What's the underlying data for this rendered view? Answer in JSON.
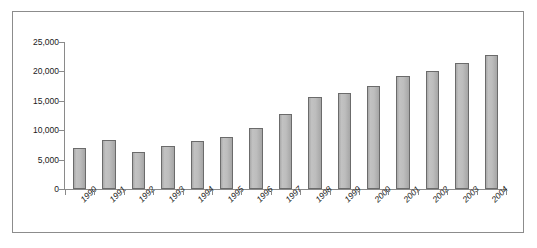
{
  "chart_data": {
    "type": "bar",
    "title": "",
    "subtitle": "",
    "xlabel": "",
    "ylabel": "",
    "categories": [
      "1990",
      "1991",
      "1992",
      "1993",
      "1994",
      "1995",
      "1996",
      "1997",
      "1998",
      "1999",
      "2000",
      "2001",
      "2002",
      "2003",
      "2004"
    ],
    "values": [
      7000,
      8400,
      6300,
      7300,
      8100,
      8900,
      10400,
      12700,
      15600,
      16300,
      17600,
      19200,
      20000,
      21500,
      22800
    ],
    "series": [
      {
        "name": "",
        "values": [
          7000,
          8400,
          6300,
          7300,
          8100,
          8900,
          10400,
          12700,
          15600,
          16300,
          17600,
          19200,
          20000,
          21500,
          22800
        ]
      }
    ],
    "ylim": [
      0,
      25000
    ],
    "yticks": [
      0,
      5000,
      10000,
      15000,
      20000,
      25000
    ],
    "ytick_labels": [
      "0",
      "5,000",
      "10,000",
      "15,000",
      "20,000",
      "25,000"
    ],
    "grid": false,
    "legend": false,
    "legend_position": "none",
    "bar_color": "#b5b5b5",
    "bar_border_color": "#6b6b6b",
    "axis_color": "#8a8a8a",
    "frame_color": "#8c8c8c",
    "background_color": "#ffffff",
    "xtick_label_rotation": -45,
    "annotations": []
  }
}
